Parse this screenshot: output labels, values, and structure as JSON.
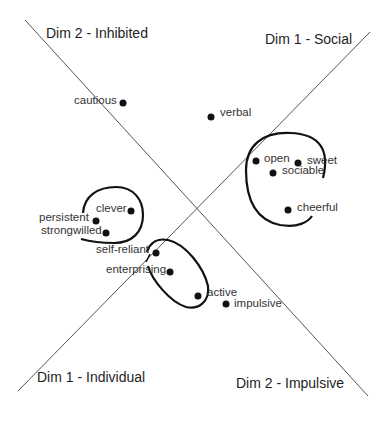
{
  "diagram": {
    "type": "two-dimensional scatter map with rotated axes",
    "axes": {
      "dim2_inhibited": "Dim 2 - Inhibited",
      "dim1_social": "Dim 1 - Social",
      "dim1_individual": "Dim 1 - Individual",
      "dim2_impulsive": "Dim 2 - Impulsive"
    },
    "points": [
      {
        "id": "cautious",
        "label": "cautious",
        "x": 123,
        "y": 103
      },
      {
        "id": "verbal",
        "label": "verbal",
        "x": 211,
        "y": 117
      },
      {
        "id": "open",
        "label": "open",
        "x": 256,
        "y": 161
      },
      {
        "id": "sweet",
        "label": "sweet",
        "x": 298,
        "y": 163
      },
      {
        "id": "sociable",
        "label": "sociable",
        "x": 273,
        "y": 173
      },
      {
        "id": "cheerful",
        "label": "cheerful",
        "x": 288,
        "y": 210
      },
      {
        "id": "clever",
        "label": "clever",
        "x": 131,
        "y": 211
      },
      {
        "id": "persistent",
        "label": "persistent",
        "x": 96,
        "y": 221
      },
      {
        "id": "strongwilled",
        "label": "strongwilled",
        "x": 106,
        "y": 233
      },
      {
        "id": "self-reliant",
        "label": "self-reliant",
        "x": 156,
        "y": 253
      },
      {
        "id": "enterprising",
        "label": "enterprising",
        "x": 170,
        "y": 272
      },
      {
        "id": "active",
        "label": "active",
        "x": 198,
        "y": 296
      },
      {
        "id": "impulsive",
        "label": "impulsive",
        "x": 226,
        "y": 304
      }
    ],
    "clusters": [
      {
        "id": "social-cluster",
        "members": [
          "open",
          "sweet",
          "sociable",
          "cheerful"
        ]
      },
      {
        "id": "persistent-cluster",
        "members": [
          "clever",
          "persistent",
          "strongwilled"
        ]
      },
      {
        "id": "enterprising-cluster",
        "members": [
          "self-reliant",
          "enterprising",
          "active"
        ]
      }
    ],
    "colors": {
      "line": "#555555",
      "ink": "#111111",
      "text": "#333333",
      "background": "#ffffff"
    }
  }
}
